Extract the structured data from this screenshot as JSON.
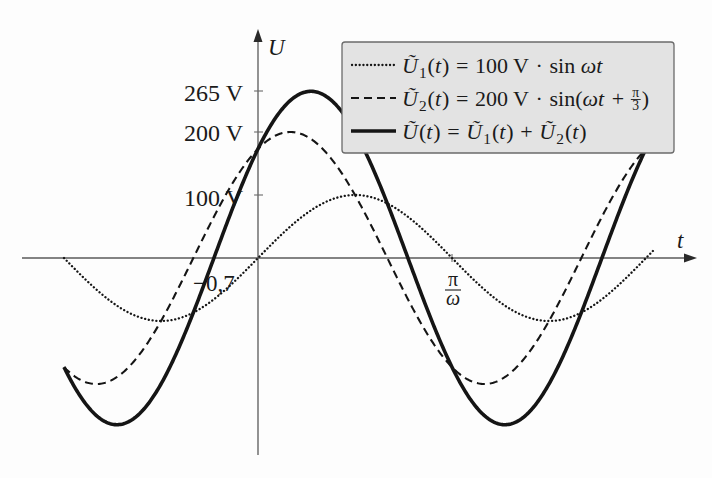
{
  "chart_data": {
    "type": "line",
    "title": "",
    "xlabel": "t",
    "ylabel": "U",
    "grid": false,
    "legend_position": "top-right",
    "x_unit": "ωt / π",
    "x_range_over_pi": [
      -1.0,
      2.04
    ],
    "y_ticks": [
      {
        "value": 265,
        "label": "265 V"
      },
      {
        "value": 200,
        "label": "200 V"
      },
      {
        "value": 100,
        "label": "100 V"
      }
    ],
    "x_ticks": [
      {
        "value_over_pi": 1,
        "label": "π/ω",
        "numerator": "π",
        "denominator": "ω"
      }
    ],
    "annotations": [
      {
        "value_over_pi": -0.2228,
        "label": "−0,7"
      }
    ],
    "x": [
      -1,
      -0.833,
      -0.667,
      -0.5,
      -0.333,
      -0.167,
      0,
      0.167,
      0.333,
      0.5,
      0.667,
      0.833,
      1,
      1.167,
      1.333,
      1.5,
      1.667,
      1.833,
      2
    ],
    "series": [
      {
        "name": "Ũ1(t) = 100 V · sin ωt",
        "style": "dotted",
        "amplitude": 100,
        "phase_rad": 0,
        "values": [
          0,
          -50,
          -86.6,
          -100,
          -86.6,
          -50,
          0,
          50,
          86.6,
          100,
          86.6,
          50,
          0,
          -50,
          -86.6,
          -100,
          -86.6,
          -50,
          0
        ]
      },
      {
        "name": "Ũ2(t) = 200 V · sin(ωt + π/3)",
        "style": "dashed",
        "amplitude": 200,
        "phase_rad": 1.0472,
        "values": [
          -173.2,
          -200,
          -173.2,
          -100,
          0,
          100,
          173.2,
          200,
          173.2,
          100,
          0,
          -100,
          -173.2,
          -200,
          -173.2,
          -100,
          0,
          100,
          173.2
        ]
      },
      {
        "name": "Ũ(t) = Ũ1(t) + Ũ2(t)",
        "style": "solid",
        "amplitude": 264.6,
        "phase_rad": 0.7137,
        "values": [
          -173.2,
          -250,
          -259.8,
          -200,
          -86.6,
          50,
          173.2,
          250,
          259.8,
          200,
          86.6,
          -50,
          -173.2,
          -250,
          -259.8,
          -200,
          -86.6,
          50,
          173.2
        ]
      }
    ]
  },
  "legend": {
    "entries": [
      {
        "style": "dotted",
        "parts": [
          {
            "t": "Ũ",
            "i": 1
          },
          {
            "t": "1",
            "sub": 1
          },
          {
            "t": "("
          },
          {
            "t": "t",
            "i": 1
          },
          {
            "t": ")"
          },
          {
            "t": "=",
            "op": 1
          },
          {
            "t": "100 V"
          },
          {
            "t": "·",
            "op": 1
          },
          {
            "t": "sin "
          },
          {
            "t": "ωt",
            "i": 1
          }
        ]
      },
      {
        "style": "dashed",
        "parts": [
          {
            "t": "Ũ",
            "i": 1
          },
          {
            "t": "2",
            "sub": 1
          },
          {
            "t": "("
          },
          {
            "t": "t",
            "i": 1
          },
          {
            "t": ")"
          },
          {
            "t": "=",
            "op": 1
          },
          {
            "t": "200 V"
          },
          {
            "t": "·",
            "op": 1
          },
          {
            "t": "sin("
          },
          {
            "t": "ωt",
            "i": 1
          },
          {
            "t": "+",
            "op": 1
          },
          {
            "frac": [
              "π",
              "3"
            ]
          },
          {
            "t": ")"
          }
        ]
      },
      {
        "style": "solid",
        "parts": [
          {
            "t": "Ũ",
            "i": 1
          },
          {
            "t": "("
          },
          {
            "t": "t",
            "i": 1
          },
          {
            "t": ")"
          },
          {
            "t": "=",
            "op": 1
          },
          {
            "t": "Ũ",
            "i": 1
          },
          {
            "t": "1",
            "sub": 1
          },
          {
            "t": "("
          },
          {
            "t": "t",
            "i": 1
          },
          {
            "t": ")"
          },
          {
            "t": "+",
            "op": 1
          },
          {
            "t": "Ũ",
            "i": 1
          },
          {
            "t": "2",
            "sub": 1
          },
          {
            "t": "("
          },
          {
            "t": "t",
            "i": 1
          },
          {
            "t": ")"
          }
        ]
      }
    ]
  }
}
